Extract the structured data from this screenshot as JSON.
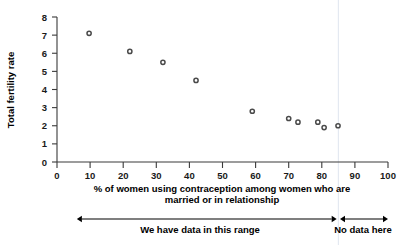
{
  "chart_data": {
    "type": "scatter",
    "title": "",
    "xlabel": "% of women using contraception among women who are married or in relationship",
    "ylabel": "Total fertility rate",
    "xlim": [
      0,
      100
    ],
    "ylim": [
      0,
      8
    ],
    "xticks": [
      0,
      10,
      20,
      30,
      40,
      50,
      60,
      70,
      80,
      90,
      100
    ],
    "yticks": [
      0,
      1,
      2,
      3,
      4,
      5,
      6,
      7,
      8
    ],
    "grid": false,
    "legend": null,
    "marker_style": "open-circle",
    "points": [
      {
        "x": 9.7,
        "y": 7.1
      },
      {
        "x": 22.0,
        "y": 6.1
      },
      {
        "x": 32.0,
        "y": 5.5
      },
      {
        "x": 42.0,
        "y": 4.5
      },
      {
        "x": 59.0,
        "y": 2.8
      },
      {
        "x": 70.0,
        "y": 2.4
      },
      {
        "x": 72.8,
        "y": 2.2
      },
      {
        "x": 78.8,
        "y": 2.2
      },
      {
        "x": 80.7,
        "y": 1.9
      },
      {
        "x": 84.9,
        "y": 2.0
      }
    ],
    "annotations": [
      {
        "name": "data-range-arrow",
        "label": "We have data in this range",
        "x_start": 6.0,
        "x_end": 84.5,
        "type": "double-arrow"
      },
      {
        "name": "no-data-arrow",
        "label": "No data here",
        "x_start": 85.5,
        "x_end": 100.0,
        "type": "double-arrow"
      }
    ],
    "divider_x": 85
  },
  "axes": {
    "x_label_line1": "% of women using contraception among women who are",
    "x_label_line2": "married or in relationship",
    "y_label": "Total fertility rate",
    "x_tick_labels": [
      "0",
      "10",
      "20",
      "30",
      "40",
      "50",
      "60",
      "70",
      "80",
      "90",
      "100"
    ],
    "y_tick_labels": [
      "0",
      "1",
      "2",
      "3",
      "4",
      "5",
      "6",
      "7",
      "8"
    ]
  },
  "annotations": {
    "range_label": "We have data in this range",
    "no_data_label": "No data here"
  },
  "colors": {
    "axis": "#3a3a3a",
    "marker_stroke": "#4a4a4a",
    "marker_fill": "#ffffff",
    "text": "#000000",
    "divider": "#dfe6ef",
    "background": "#ffffff"
  }
}
